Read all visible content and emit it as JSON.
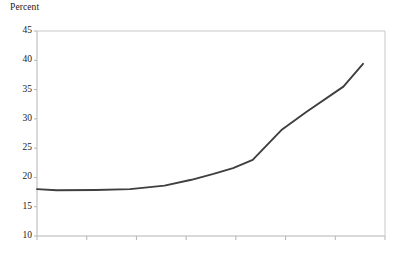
{
  "chart_data": {
    "type": "line",
    "title": "",
    "subtitle": "",
    "ylabel": "Percent",
    "xlabel": "",
    "ylim": [
      10,
      45
    ],
    "y_ticks": [
      10,
      15,
      20,
      25,
      30,
      35,
      40,
      45
    ],
    "y_tick_labels": [
      "10",
      "15",
      "20",
      "25",
      "30",
      "35",
      "40",
      "45"
    ],
    "x_ticks_count": 8,
    "x_tick_labels": [
      "",
      "",
      "",
      "",
      "",
      "",
      "",
      ""
    ],
    "grid": false,
    "legend": null,
    "series": [
      {
        "name": "Percent",
        "color": "#3f3f3f",
        "x": [
          0,
          1,
          2,
          3,
          4,
          5,
          6,
          7,
          8,
          9,
          10,
          11,
          12
        ],
        "values": [
          18.0,
          17.9,
          17.8,
          17.8,
          18.0,
          18.3,
          19.2,
          20.3,
          21.5,
          23.0,
          26.0,
          28.3,
          31.2
        ]
      }
    ],
    "annotations": []
  },
  "axes": {
    "frame_color": "#b4b4b4",
    "tick_color": "#b4b4b4",
    "label_color": "#1a1a1a"
  },
  "line_points": [
    {
      "x": 0,
      "y": 18.0
    },
    {
      "x": 8,
      "y": 17.8
    },
    {
      "x": 24,
      "y": 17.85
    },
    {
      "x": 38,
      "y": 18.0
    },
    {
      "x": 52,
      "y": 18.6
    },
    {
      "x": 63,
      "y": 19.6
    },
    {
      "x": 72,
      "y": 20.6
    },
    {
      "x": 80,
      "y": 21.6
    },
    {
      "x": 88,
      "y": 23.0
    },
    {
      "x": 100,
      "y": 28.2
    },
    {
      "x": 110,
      "y": 31.2
    },
    {
      "x": 125,
      "y": 35.5
    },
    {
      "x": 133,
      "y": 39.4
    }
  ]
}
